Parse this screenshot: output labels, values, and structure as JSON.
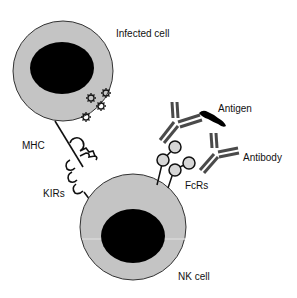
{
  "diagram": {
    "labels": {
      "infected_cell": "Infected cell",
      "mhc": "MHC",
      "kirs": "KIRs",
      "antigen": "Antigen",
      "antibody": "Antibody",
      "fcrs": "FcRs",
      "nk_cell": "NK cell"
    },
    "colors": {
      "cytoplasm": "#c4c4c4",
      "nucleus": "#000000",
      "receptor_fill": "#d6d6d6",
      "antibody": "#4a4a4a",
      "outline": "#222222"
    }
  }
}
